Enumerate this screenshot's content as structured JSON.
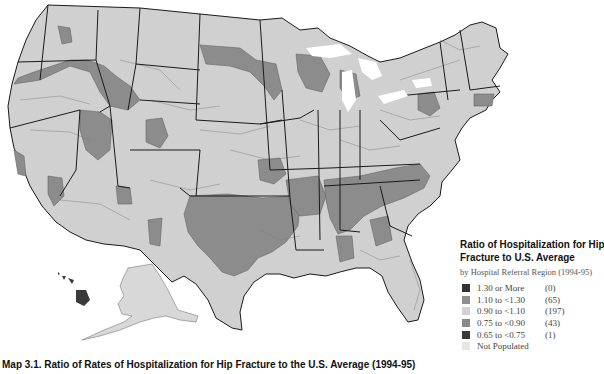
{
  "map": {
    "title": "Ratio of Hospitalization for Hip Fracture to U.S. Average",
    "colors": {
      "background": "#ffffff",
      "ocean": "#ffffff",
      "state_border": "#1a1a1a",
      "region_border": "#6e6e6e",
      "class_1_30_plus": "#3a3a3a",
      "class_1_10_to_1_30": "#8c8c8c",
      "class_0_90_to_1_10": "#cfcfcf",
      "class_0_75_to_0_90": "#8a8a8a",
      "class_0_65_to_0_75": "#3c3c3c",
      "not_populated": "#e4e4e4"
    }
  },
  "legend": {
    "title_line1": "Ratio of Hospitalization for Hip",
    "title_line2": "Fracture to U.S. Average",
    "subtitle": "by Hospital Referral Region (1994-95)",
    "items": [
      {
        "label": "1.30 or More",
        "count": "(0)",
        "color": "#333333"
      },
      {
        "label": "1.10 to <1.30",
        "count": "(65)",
        "color": "#8e8e8e"
      },
      {
        "label": "0.90 to <1.10",
        "count": "(197)",
        "color": "#d2d2d2"
      },
      {
        "label": "0.75 to <0.90",
        "count": "(43)",
        "color": "#8a8a8a"
      },
      {
        "label": "0.65 to <0.75",
        "count": "(1)",
        "color": "#3a3a3a"
      },
      {
        "label": "Not Populated",
        "count": "",
        "color": "#e6e6e6"
      }
    ]
  },
  "caption": "Map 3.1. Ratio of Rates of Hospitalization for Hip Fracture to the U.S. Average (1994-95)"
}
